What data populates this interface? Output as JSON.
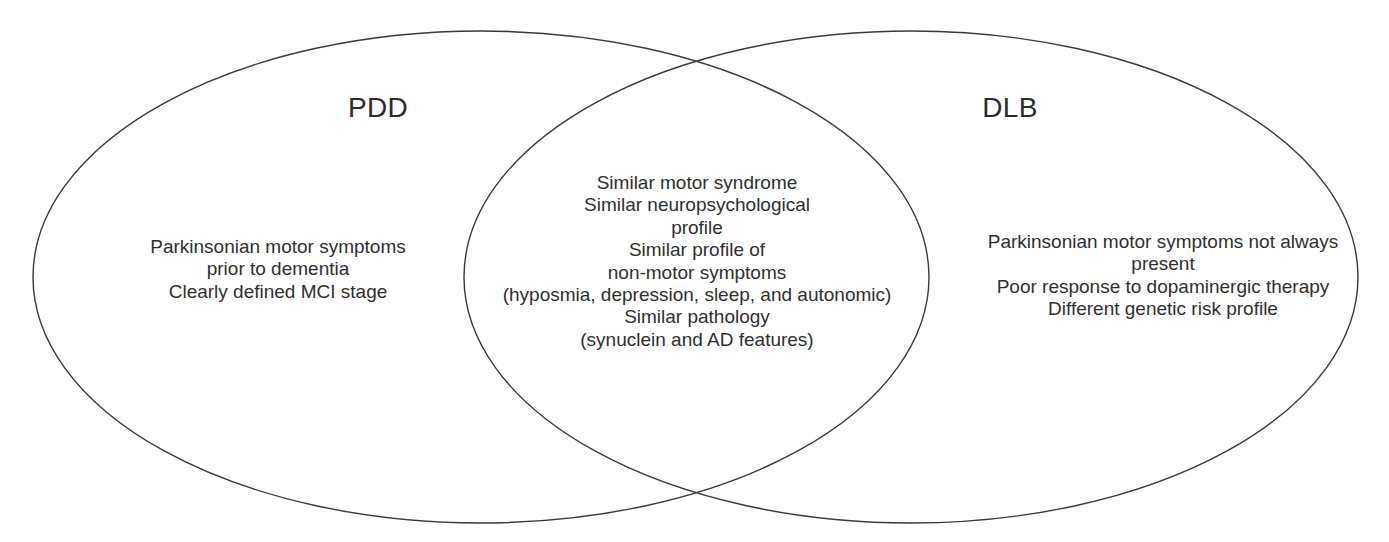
{
  "diagram": {
    "type": "venn",
    "background_color": "#ffffff",
    "stroke_color": "#3a3a3a",
    "text_color": "#2f2f2f",
    "title_color": "#2b2b2b",
    "left_circle": {
      "label": "PDD",
      "cx": 481,
      "cy": 277,
      "rx": 448,
      "ry": 246
    },
    "right_circle": {
      "label": "DLB",
      "cx": 911,
      "cy": 277,
      "rx": 447,
      "ry": 246
    }
  },
  "left_only": {
    "lines": [
      "Parkinsonian motor symptoms",
      "prior to dementia",
      "Clearly defined MCI stage"
    ]
  },
  "intersection": {
    "lines": [
      "Similar motor syndrome",
      "Similar neuropsychological",
      "profile",
      "Similar profile of",
      "non-motor symptoms",
      "(hyposmia, depression, sleep, and autonomic)",
      "Similar pathology",
      "(synuclein and AD features)"
    ]
  },
  "right_only": {
    "lines": [
      "Parkinsonian motor symptoms not always",
      "present",
      "Poor response to dopaminergic therapy",
      "Different genetic risk profile"
    ]
  }
}
